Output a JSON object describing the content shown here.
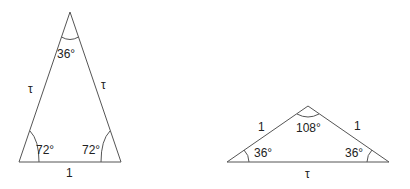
{
  "figure": {
    "triangles": [
      {
        "name": "golden-triangle",
        "vertices": {
          "apex": [
            70,
            12
          ],
          "left": [
            19,
            162
          ],
          "right": [
            121,
            162
          ]
        },
        "side_labels": {
          "left": "τ",
          "right": "τ",
          "base": "1"
        },
        "angle_labels": {
          "apex": "36°",
          "left": "72°",
          "right": "72°"
        }
      },
      {
        "name": "golden-gnomon",
        "vertices": {
          "apex": [
            308,
            106
          ],
          "left": [
            227,
            162
          ],
          "right": [
            389,
            162
          ]
        },
        "side_labels": {
          "left": "1",
          "right": "1",
          "base": "τ"
        },
        "angle_labels": {
          "apex": "108°",
          "left": "36°",
          "right": "36°"
        }
      }
    ],
    "colors": {
      "line": "#555555",
      "text": "#222222",
      "background": "#ffffff"
    }
  }
}
